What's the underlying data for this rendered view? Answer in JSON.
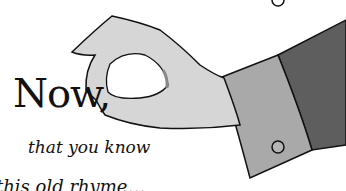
{
  "page": {
    "heading": "Now,",
    "subheading": "that you know",
    "partial_line": "this old rhyme…",
    "illustration": "hand-pinching-illustration"
  }
}
